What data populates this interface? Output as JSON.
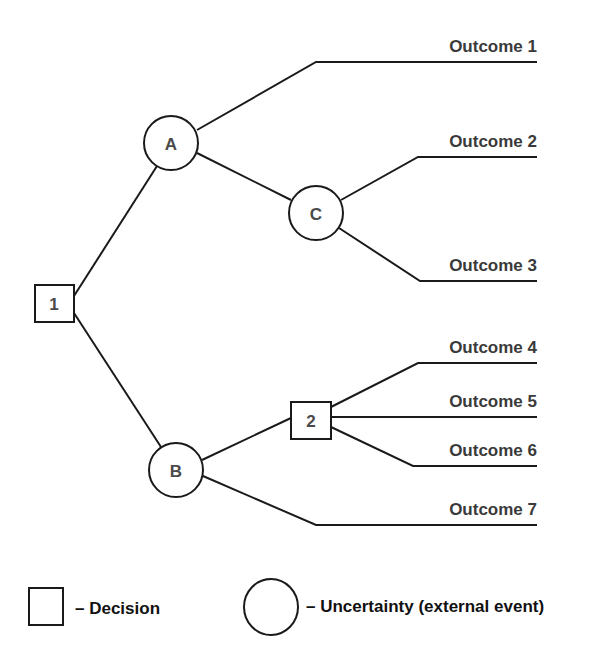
{
  "diagram": {
    "type": "decision-tree",
    "nodes": {
      "d1": {
        "label": "1",
        "shape": "square"
      },
      "a": {
        "label": "A",
        "shape": "circle"
      },
      "b": {
        "label": "B",
        "shape": "circle"
      },
      "c": {
        "label": "C",
        "shape": "circle"
      },
      "d2": {
        "label": "2",
        "shape": "square"
      }
    },
    "edges": [
      {
        "from": "1",
        "to": "A"
      },
      {
        "from": "1",
        "to": "B"
      },
      {
        "from": "A",
        "to": "Outcome 1"
      },
      {
        "from": "A",
        "to": "C"
      },
      {
        "from": "C",
        "to": "Outcome 2"
      },
      {
        "from": "C",
        "to": "Outcome 3"
      },
      {
        "from": "B",
        "to": "2"
      },
      {
        "from": "B",
        "to": "Outcome 7"
      },
      {
        "from": "2",
        "to": "Outcome 4"
      },
      {
        "from": "2",
        "to": "Outcome 5"
      },
      {
        "from": "2",
        "to": "Outcome 6"
      }
    ],
    "outcomes": [
      "Outcome 1",
      "Outcome 2",
      "Outcome 3",
      "Outcome 4",
      "Outcome 5",
      "Outcome 6",
      "Outcome 7"
    ]
  },
  "legend": {
    "decision": "– Decision",
    "uncertainty": "– Uncertainty (external event)"
  },
  "colors": {
    "stroke": "#1a1a1a",
    "node_text": "#4a4a4a",
    "outcome_text": "#3a3a3a",
    "background": "#ffffff"
  }
}
